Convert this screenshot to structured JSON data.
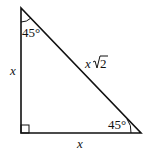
{
  "diagram": {
    "type": "45-45-90 right triangle",
    "vertices": {
      "top": [
        21,
        8
      ],
      "bottom_left": [
        21,
        133
      ],
      "bottom_right": [
        141,
        133
      ]
    },
    "labels": {
      "top_angle": "45°",
      "right_angle": "45°",
      "left_side": "x",
      "bottom_side": "x",
      "hypotenuse_var": "x",
      "hypotenuse_root": "2"
    },
    "stroke_color": "#111111"
  }
}
